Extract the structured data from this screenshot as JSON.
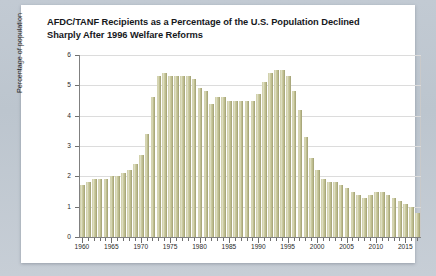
{
  "card": {
    "title_line1": "AFDC/TANF Recipients as a Percentage of the U.S. Population Declined",
    "title_line2": "Sharply After 1996 Welfare Reforms"
  },
  "colors": {
    "page_background": "#b9c2cc",
    "card_background": "#ffffff",
    "bar_fill": "#c8c79b",
    "bar_highlight": "#dedec2",
    "axis": "#707070",
    "gridline": "#dcdcdc",
    "title_text": "#16181c"
  },
  "chart_data": {
    "type": "bar",
    "title": "AFDC/TANF Recipients as a Percentage of the U.S. Population Declined Sharply After 1996 Welfare Reforms",
    "xlabel": "",
    "ylabel": "Percentage of population",
    "ylim": [
      0,
      6
    ],
    "yticks": [
      0,
      1,
      2,
      3,
      4,
      5,
      6
    ],
    "ytick_labels": [
      "0",
      "1",
      "2",
      "3",
      "4",
      "5",
      "6"
    ],
    "xlim": [
      1959.5,
      2017.5
    ],
    "xtick_labels": [
      "1960",
      "1965",
      "1970",
      "1975",
      "1980",
      "1985",
      "1990",
      "1995",
      "2000",
      "2005",
      "2010",
      "2015"
    ],
    "xticks": [
      1960,
      1965,
      1970,
      1975,
      1980,
      1985,
      1990,
      1995,
      2000,
      2005,
      2010,
      2015
    ],
    "grid": true,
    "legend": false,
    "categories": [
      1960,
      1961,
      1962,
      1963,
      1964,
      1965,
      1966,
      1967,
      1968,
      1969,
      1970,
      1971,
      1972,
      1973,
      1974,
      1975,
      1976,
      1977,
      1978,
      1979,
      1980,
      1981,
      1982,
      1983,
      1984,
      1985,
      1986,
      1987,
      1988,
      1989,
      1990,
      1991,
      1992,
      1993,
      1994,
      1995,
      1996,
      1997,
      1998,
      1999,
      2000,
      2001,
      2002,
      2003,
      2004,
      2005,
      2006,
      2007,
      2008,
      2009,
      2010,
      2011,
      2012,
      2013,
      2014,
      2015,
      2016,
      2017
    ],
    "values": [
      1.7,
      1.8,
      1.9,
      1.9,
      1.9,
      2.0,
      2.0,
      2.1,
      2.2,
      2.4,
      2.7,
      3.4,
      4.6,
      5.3,
      5.4,
      5.3,
      5.3,
      5.3,
      5.3,
      5.2,
      4.9,
      4.8,
      4.4,
      4.6,
      4.6,
      4.5,
      4.5,
      4.5,
      4.5,
      4.5,
      4.7,
      5.1,
      5.4,
      5.5,
      5.5,
      5.3,
      4.8,
      4.2,
      3.3,
      2.6,
      2.2,
      1.9,
      1.8,
      1.8,
      1.7,
      1.6,
      1.5,
      1.4,
      1.3,
      1.4,
      1.5,
      1.5,
      1.4,
      1.3,
      1.2,
      1.1,
      1.0,
      0.8
    ]
  }
}
